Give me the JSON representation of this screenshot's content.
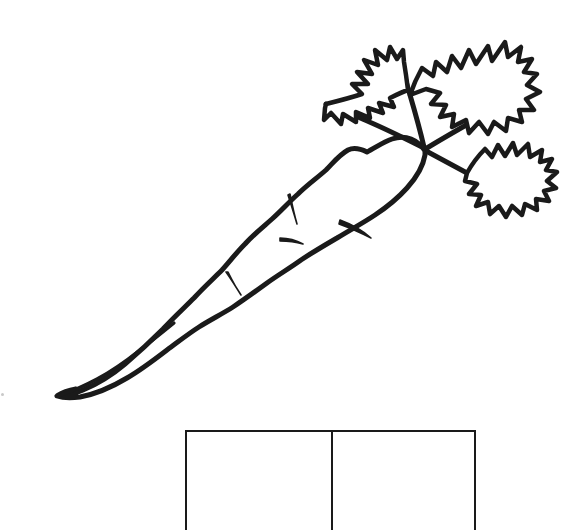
{
  "page": {
    "background_color": "#ffffff",
    "ink_color": "#1a1a1a",
    "width": 566,
    "height": 530
  },
  "illustration": {
    "name": "carrot-line-drawing",
    "subject": "carrot",
    "style": "black outline line art, uncolored",
    "stroke_color": "#1a1a1a",
    "fill_color": "#ffffff",
    "orientation": "diagonal, tip at lower-left, leafy top at upper-right",
    "parts": [
      {
        "name": "carrot-root-body",
        "label": "Carrot root"
      },
      {
        "name": "carrot-tip",
        "label": "Carrot tip"
      },
      {
        "name": "carrot-ridge-marks",
        "label": "Root ridge marks",
        "count": 4
      },
      {
        "name": "carrot-stems",
        "label": "Leaf stems",
        "count": 4
      },
      {
        "name": "carrot-leaf-upper-left",
        "label": "Upper left leaf"
      },
      {
        "name": "carrot-leaf-upper-right",
        "label": "Upper right leaf"
      },
      {
        "name": "carrot-leaf-lower-right",
        "label": "Lower right leaf"
      }
    ]
  },
  "answer_boxes": {
    "name": "answer-boxes",
    "count": 2,
    "border_color": "#1a1a1a",
    "border_width_px": 2,
    "cells": [
      {
        "name": "answer-cell-1",
        "value": ""
      },
      {
        "name": "answer-cell-2",
        "value": ""
      }
    ]
  },
  "artifacts": {
    "speck": {
      "name": "scan-speck",
      "color": "#c9c9c9"
    }
  }
}
